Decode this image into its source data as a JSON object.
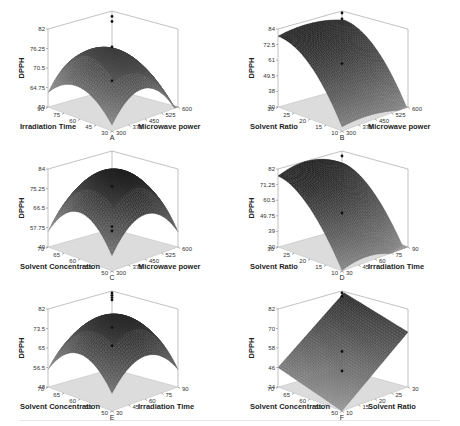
{
  "figure": {
    "panels": [
      {
        "id": "A",
        "zlabel": "DPPH",
        "xlabel": "Irradiation Time",
        "ylabel": "Microwave power",
        "zticks": [
          "82",
          "76.25",
          "70.5",
          "64.75",
          "59"
        ],
        "xticks": [
          "90",
          "75",
          "60",
          "45",
          "30"
        ],
        "yticks": [
          "300",
          "375",
          "450",
          "525",
          "600"
        ]
      },
      {
        "id": "B",
        "zlabel": "DPPH",
        "xlabel": "Solvent Ratio",
        "ylabel": "Microwave power",
        "zticks": [
          "84",
          "72.5",
          "61",
          "49.5",
          "38",
          "30"
        ],
        "xticks": [
          "30",
          "25",
          "20",
          "15",
          "10"
        ],
        "yticks": [
          "300",
          "375",
          "450",
          "525",
          "600"
        ]
      },
      {
        "id": "C",
        "zlabel": "DPPH",
        "xlabel": "Solvent Concentration",
        "ylabel": "Microwave power",
        "zticks": [
          "84",
          "75.25",
          "66.5",
          "57.75",
          "49"
        ],
        "xticks": [
          "70",
          "65",
          "60",
          "55",
          "50"
        ],
        "yticks": [
          "300",
          "375",
          "450",
          "525",
          "600"
        ]
      },
      {
        "id": "D",
        "zlabel": "DPPH",
        "xlabel": "Solvent Ratio",
        "ylabel": "Irradiation Time",
        "zticks": [
          "82",
          "71.25",
          "60.5",
          "49.75",
          "39",
          "30"
        ],
        "xticks": [
          "30",
          "25",
          "20",
          "15",
          "10"
        ],
        "yticks": [
          "30",
          "45",
          "60",
          "75",
          "90"
        ]
      },
      {
        "id": "E",
        "zlabel": "DPPH",
        "xlabel": "Solvent Concentration",
        "ylabel": "Irradiation Time",
        "zticks": [
          "82",
          "73.5",
          "65",
          "56.5",
          "48"
        ],
        "xticks": [
          "70",
          "65",
          "60",
          "55",
          "50"
        ],
        "yticks": [
          "30",
          "45",
          "60",
          "75",
          "90"
        ]
      },
      {
        "id": "F",
        "zlabel": "DPPH",
        "xlabel": "Solvent Concentration",
        "ylabel": "Solvent Ratio",
        "zticks": [
          "82",
          "70",
          "58",
          "46",
          "34"
        ],
        "xticks": [
          "70",
          "65",
          "60",
          "55",
          "50"
        ],
        "yticks": [
          "10",
          "15",
          "20",
          "25",
          "30"
        ]
      }
    ]
  },
  "chart_data": [
    {
      "type": "surface",
      "title": "A",
      "zlabel": "DPPH",
      "xlabel": "Irradiation Time",
      "ylabel": "Microwave power",
      "xlim": [
        30,
        90
      ],
      "ylim": [
        300,
        600
      ],
      "zlim": [
        59,
        82
      ],
      "zticks": [
        59,
        64.75,
        70.5,
        76.25,
        82
      ],
      "xticks": [
        30,
        45,
        60,
        75,
        90
      ],
      "yticks": [
        300,
        375,
        450,
        525,
        600
      ],
      "corners": {
        "x90_y300": 68,
        "x30_y300": 62,
        "x30_y600": 63,
        "center": 79
      },
      "design_points": [
        {
          "z": 81
        },
        {
          "z": 79.5
        },
        {
          "z": 72
        },
        {
          "z": 62
        }
      ]
    },
    {
      "type": "surface",
      "title": "B",
      "zlabel": "DPPH",
      "xlabel": "Solvent Ratio",
      "ylabel": "Microwave power",
      "xlim": [
        10,
        30
      ],
      "ylim": [
        300,
        600
      ],
      "zlim": [
        30,
        84
      ],
      "zticks": [
        30,
        38,
        49.5,
        61,
        72.5,
        84
      ],
      "xticks": [
        10,
        15,
        20,
        25,
        30
      ],
      "yticks": [
        300,
        375,
        450,
        525,
        600
      ],
      "corners": {
        "x30_y300": 78,
        "x10_y300": 35,
        "x10_y600": 49
      },
      "design_points": [
        {
          "z": 84
        },
        {
          "z": 80
        },
        {
          "z": 49
        }
      ]
    },
    {
      "type": "surface",
      "title": "C",
      "zlabel": "DPPH",
      "xlabel": "Solvent Concentration",
      "ylabel": "Microwave power",
      "xlim": [
        50,
        70
      ],
      "ylim": [
        300,
        600
      ],
      "zlim": [
        49,
        84
      ],
      "zticks": [
        49,
        57.75,
        66.5,
        75.25,
        84
      ],
      "xticks": [
        50,
        55,
        60,
        65,
        70
      ],
      "yticks": [
        300,
        375,
        450,
        525,
        600
      ],
      "corners": {
        "x70_y300": 49,
        "center": 82,
        "x50_y600": 60
      },
      "design_points": [
        {
          "z": 49
        },
        {
          "z": 69
        },
        {
          "z": 51
        }
      ]
    },
    {
      "type": "surface",
      "title": "D",
      "zlabel": "DPPH",
      "xlabel": "Solvent Ratio",
      "ylabel": "Irradiation Time",
      "xlim": [
        10,
        30
      ],
      "ylim": [
        30,
        90
      ],
      "zlim": [
        30,
        82
      ],
      "zticks": [
        30,
        39,
        49.75,
        60.5,
        71.25,
        82
      ],
      "xticks": [
        10,
        15,
        20,
        25,
        30
      ],
      "yticks": [
        30,
        45,
        60,
        75,
        90
      ],
      "corners": {
        "x30_y30": 62,
        "x10_y30": 33,
        "x10_y90": 42
      },
      "design_points": [
        {
          "z": 80
        },
        {
          "z": 42
        }
      ]
    },
    {
      "type": "surface",
      "title": "E",
      "zlabel": "DPPH",
      "xlabel": "Solvent Concentration",
      "ylabel": "Irradiation Time",
      "xlim": [
        50,
        70
      ],
      "ylim": [
        30,
        90
      ],
      "zlim": [
        48,
        82
      ],
      "zticks": [
        48,
        56.5,
        65,
        73.5,
        82
      ],
      "xticks": [
        50,
        55,
        60,
        65,
        70
      ],
      "yticks": [
        30,
        45,
        60,
        75,
        90
      ],
      "corners": {
        "x70_y30": 48,
        "center": 78,
        "x50_y90": 58
      },
      "design_points": [
        {
          "z": 82
        },
        {
          "z": 81
        },
        {
          "z": 80
        },
        {
          "z": 79
        },
        {
          "z": 67
        },
        {
          "z": 59
        }
      ]
    },
    {
      "type": "surface",
      "title": "F",
      "zlabel": "DPPH",
      "xlabel": "Solvent Concentration",
      "ylabel": "Solvent Ratio",
      "xlim": [
        50,
        70
      ],
      "ylim": [
        10,
        30
      ],
      "zlim": [
        34,
        82
      ],
      "zticks": [
        34,
        46,
        58,
        70,
        82
      ],
      "xticks": [
        50,
        55,
        60,
        65,
        70
      ],
      "yticks": [
        10,
        15,
        20,
        25,
        30
      ],
      "corners": {
        "x70_y10": 46,
        "x50_y10": 34,
        "x50_y30": 80
      },
      "design_points": [
        {
          "z": 82
        },
        {
          "z": 46
        },
        {
          "z": 80
        },
        {
          "z": 34
        }
      ]
    }
  ]
}
